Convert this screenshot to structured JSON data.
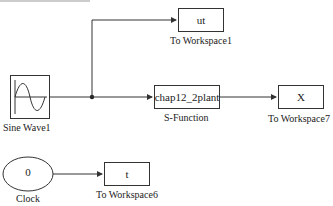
{
  "diagram": {
    "blocks": {
      "sine_wave": {
        "label": "Sine Wave1"
      },
      "clock": {
        "value": "0",
        "label": "Clock"
      },
      "sfunction": {
        "text": "chap12_2plant",
        "label": "S-Function"
      },
      "ws_ut": {
        "text": "ut",
        "label": "To Workspace1"
      },
      "ws_x": {
        "text": "X",
        "label": "To Workspace7"
      },
      "ws_t": {
        "text": "t",
        "label": "To Workspace6"
      }
    },
    "line_color": "#333333"
  }
}
